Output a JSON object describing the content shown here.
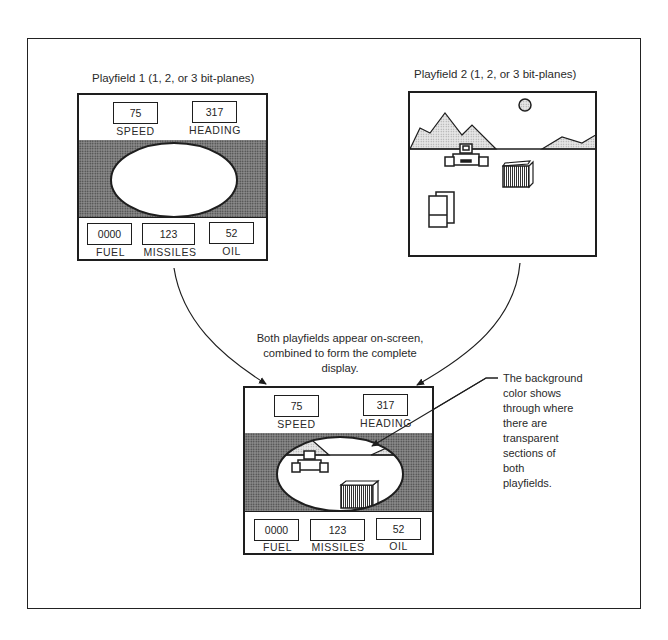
{
  "figure": {
    "playfield1": {
      "title": "Playfield 1 (1, 2, or 3 bit-planes)",
      "gauges_top": [
        {
          "value": "75",
          "label": "SPEED"
        },
        {
          "value": "317",
          "label": "HEADING"
        }
      ],
      "gauges_bottom": [
        {
          "value": "0000",
          "label": "FUEL"
        },
        {
          "value": "123",
          "label": "MISSILES"
        },
        {
          "value": "52",
          "label": "OIL"
        }
      ]
    },
    "playfield2": {
      "title": "Playfield 2 (1, 2, or 3 bit-planes)",
      "elements": [
        "sun",
        "mountains",
        "vehicle",
        "crate",
        "panels"
      ]
    },
    "combined": {
      "caption": [
        "Both playfields appear on-screen,",
        "combined to form the complete",
        "display."
      ],
      "gauges_top": [
        {
          "value": "75",
          "label": "SPEED"
        },
        {
          "value": "317",
          "label": "HEADING"
        }
      ],
      "gauges_bottom": [
        {
          "value": "0000",
          "label": "FUEL"
        },
        {
          "value": "123",
          "label": "MISSILES"
        },
        {
          "value": "52",
          "label": "OIL"
        }
      ]
    },
    "callout": {
      "lines": [
        "The background",
        "color shows",
        "through where",
        "there are",
        "transparent",
        "sections of",
        "both",
        "playfields."
      ]
    },
    "colors": {
      "ink": "#1e1e1e",
      "screen_gray": "#8a8a8a",
      "mountain_fill": "#d8d8d8"
    }
  }
}
